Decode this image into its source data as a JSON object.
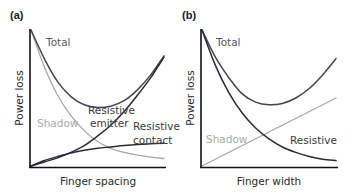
{
  "colors": {
    "dark": "#2b2b36",
    "total": "#4a4450",
    "shadow": "#a8a8a8",
    "axis": "#111111",
    "text_dark": "#3a3a3a",
    "text_shadow": "#a0a0a0"
  },
  "chart_data": [
    {
      "panel": "(a)",
      "type": "line",
      "xlabel": "Finger spacing",
      "ylabel": "Power loss",
      "xlim": [
        0,
        1
      ],
      "ylim": [
        0,
        1
      ],
      "grid": false,
      "series": [
        {
          "name": "Total",
          "label_lines": [
            "Total"
          ],
          "color_key": "total",
          "x": [
            0,
            0.1,
            0.2,
            0.3,
            0.4,
            0.5,
            0.6,
            0.7,
            0.8,
            0.9,
            1.0
          ],
          "y": [
            1.0,
            0.79,
            0.62,
            0.51,
            0.45,
            0.43,
            0.44,
            0.48,
            0.56,
            0.67,
            0.81
          ]
        },
        {
          "name": "Shadow",
          "label_lines": [
            "Shadow"
          ],
          "color_key": "shadow",
          "x": [
            0,
            0.1,
            0.2,
            0.3,
            0.4,
            0.5,
            0.6,
            0.7,
            0.8,
            0.9,
            1.0
          ],
          "y": [
            1.0,
            0.73,
            0.52,
            0.37,
            0.26,
            0.18,
            0.13,
            0.1,
            0.08,
            0.065,
            0.055
          ]
        },
        {
          "name": "Resistive emitter",
          "label_lines": [
            "Resistive",
            "emitter"
          ],
          "color_key": "dark",
          "x": [
            0,
            0.1,
            0.2,
            0.3,
            0.4,
            0.5,
            0.6,
            0.7,
            0.8,
            0.9,
            1.0
          ],
          "y": [
            0,
            0.03,
            0.06,
            0.1,
            0.15,
            0.22,
            0.3,
            0.4,
            0.52,
            0.65,
            0.8
          ]
        },
        {
          "name": "Resistive contact",
          "label_lines": [
            "Resistive",
            "contact"
          ],
          "color_key": "dark",
          "x": [
            0,
            0.1,
            0.2,
            0.3,
            0.4,
            0.5,
            0.6,
            0.7,
            0.8,
            0.9,
            1.0
          ],
          "y": [
            0,
            0.04,
            0.07,
            0.095,
            0.115,
            0.13,
            0.14,
            0.15,
            0.158,
            0.163,
            0.167
          ]
        }
      ]
    },
    {
      "panel": "(b)",
      "type": "line",
      "xlabel": "Finger width",
      "ylabel": "Power loss",
      "xlim": [
        0,
        1
      ],
      "ylim": [
        0,
        1
      ],
      "grid": false,
      "series": [
        {
          "name": "Total",
          "label_lines": [
            "Total"
          ],
          "color_key": "total",
          "x": [
            0,
            0.1,
            0.2,
            0.3,
            0.4,
            0.5,
            0.6,
            0.7,
            0.8,
            0.9,
            1.0
          ],
          "y": [
            1.0,
            0.8,
            0.65,
            0.53,
            0.47,
            0.45,
            0.46,
            0.5,
            0.57,
            0.67,
            0.79
          ]
        },
        {
          "name": "Shadow",
          "label_lines": [
            "Shadow"
          ],
          "color_key": "shadow",
          "x": [
            0,
            1.0
          ],
          "y": [
            0,
            0.5
          ]
        },
        {
          "name": "Resistive",
          "label_lines": [
            "Resistive"
          ],
          "color_key": "dark",
          "x": [
            0,
            0.1,
            0.2,
            0.3,
            0.4,
            0.5,
            0.6,
            0.7,
            0.8,
            0.9,
            1.0
          ],
          "y": [
            1.0,
            0.74,
            0.54,
            0.39,
            0.28,
            0.2,
            0.14,
            0.1,
            0.07,
            0.05,
            0.04
          ]
        }
      ]
    }
  ]
}
